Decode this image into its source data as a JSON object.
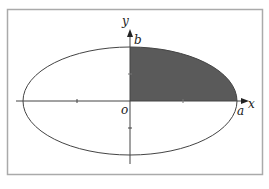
{
  "diagram": {
    "type": "ellipse-quadrant-area",
    "shape": "ellipse",
    "shaded_region": "first-quadrant",
    "labels": {
      "y_axis": "y",
      "x_axis": "x",
      "origin": "o",
      "semi_minor": "b",
      "semi_major": "a"
    },
    "colors": {
      "frame": "#aaaaaa",
      "stroke": "#444444",
      "fill": "#5a5a5a",
      "background": "#ffffff"
    }
  }
}
